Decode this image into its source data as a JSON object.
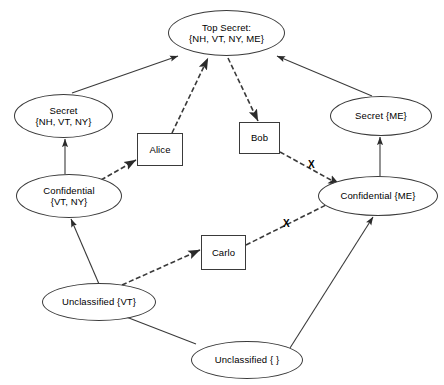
{
  "diagram": {
    "background_color": "#ffffff",
    "stroke_color": "#3a3a3a",
    "text_color": "#000000",
    "nodes": [
      {
        "id": "top-secret",
        "shape": "ellipse",
        "lines": [
          "Top Secret:",
          "{NH, VT, NY, ME}"
        ],
        "x": 168,
        "y": 10,
        "w": 117,
        "h": 46
      },
      {
        "id": "secret-nh-vt-ny",
        "shape": "ellipse",
        "lines": [
          "Secret",
          "{NH, VT, NY}"
        ],
        "x": 14,
        "y": 94,
        "w": 99,
        "h": 44
      },
      {
        "id": "secret-me",
        "shape": "ellipse",
        "lines": [
          "Secret {ME}"
        ],
        "x": 330,
        "y": 96,
        "w": 102,
        "h": 40
      },
      {
        "id": "confidential-vt-ny",
        "shape": "ellipse",
        "lines": [
          "Confidential",
          "{VT, NY}"
        ],
        "x": 16,
        "y": 174,
        "w": 106,
        "h": 44
      },
      {
        "id": "confidential-me",
        "shape": "ellipse",
        "lines": [
          "Confidential {ME}"
        ],
        "x": 318,
        "y": 176,
        "w": 120,
        "h": 40
      },
      {
        "id": "unclassified-vt",
        "shape": "ellipse",
        "lines": [
          "Unclassified {VT}"
        ],
        "x": 42,
        "y": 283,
        "w": 114,
        "h": 38
      },
      {
        "id": "unclassified-empty",
        "shape": "ellipse",
        "lines": [
          "Unclassified { }"
        ],
        "x": 191,
        "y": 341,
        "w": 112,
        "h": 38
      },
      {
        "id": "alice",
        "shape": "rect",
        "lines": [
          "Alice"
        ],
        "x": 137,
        "y": 133,
        "w": 46,
        "h": 33
      },
      {
        "id": "bob",
        "shape": "rect",
        "lines": [
          "Bob"
        ],
        "x": 239,
        "y": 122,
        "w": 41,
        "h": 32
      },
      {
        "id": "carlo",
        "shape": "rect",
        "lines": [
          "Carlo",
          ""
        ],
        "x": 201,
        "y": 235,
        "w": 45,
        "h": 35
      }
    ],
    "edges": [
      {
        "id": "secret-nhvtny-to-top-secret",
        "from": "secret-nh-vt-ny",
        "to": "top-secret",
        "style": "solid",
        "arrow": "end",
        "x1": 72,
        "y1": 93,
        "x2": 178,
        "y2": 56
      },
      {
        "id": "secret-me-to-top-secret",
        "from": "secret-me",
        "to": "top-secret",
        "style": "solid",
        "arrow": "end",
        "x1": 372,
        "y1": 96,
        "x2": 277,
        "y2": 56
      },
      {
        "id": "confidential-vtny-to-secret-nhvtny",
        "from": "confidential-vt-ny",
        "to": "secret-nh-vt-ny",
        "style": "solid",
        "arrow": "end",
        "x1": 65,
        "y1": 174,
        "x2": 65,
        "y2": 139
      },
      {
        "id": "confidential-me-to-secret-me",
        "from": "confidential-me",
        "to": "secret-me",
        "style": "solid",
        "arrow": "end",
        "x1": 380,
        "y1": 176,
        "x2": 380,
        "y2": 137
      },
      {
        "id": "unclassified-vt-to-confidential-vtny",
        "from": "unclassified-vt",
        "to": "confidential-vt-ny",
        "style": "solid",
        "arrow": "end",
        "x1": 99,
        "y1": 284,
        "x2": 71,
        "y2": 219
      },
      {
        "id": "unclassified-empty-to-unclassified-vt",
        "from": "unclassified-empty",
        "to": "unclassified-vt",
        "style": "solid",
        "arrow": "end",
        "x1": 196,
        "y1": 344,
        "x2": 116,
        "y2": 313
      },
      {
        "id": "unclassified-empty-to-confidential-me",
        "from": "unclassified-empty",
        "to": "confidential-me",
        "style": "solid",
        "arrow": "end",
        "x1": 290,
        "y1": 348,
        "x2": 373,
        "y2": 217
      },
      {
        "id": "confidential-vtny-to-alice",
        "from": "confidential-vt-ny",
        "to": "alice",
        "style": "dashed",
        "arrow": "end",
        "x1": 101,
        "y1": 180,
        "x2": 136,
        "y2": 160
      },
      {
        "id": "alice-to-top-secret",
        "from": "alice",
        "to": "top-secret",
        "style": "dashed",
        "arrow": "end",
        "x1": 172,
        "y1": 133,
        "x2": 208,
        "y2": 58
      },
      {
        "id": "top-secret-to-bob",
        "from": "top-secret",
        "to": "bob",
        "style": "dashed",
        "arrow": "end",
        "x1": 228,
        "y1": 58,
        "x2": 258,
        "y2": 121
      },
      {
        "id": "bob-to-confidential-me",
        "from": "bob",
        "to": "confidential-me",
        "style": "dashed",
        "arrow": "end",
        "blocked": true,
        "x1": 280,
        "y1": 152,
        "x2": 340,
        "y2": 185
      },
      {
        "id": "unclassified-vt-to-carlo",
        "from": "unclassified-vt",
        "to": "carlo",
        "style": "dashed",
        "arrow": "end",
        "x1": 122,
        "y1": 285,
        "x2": 200,
        "y2": 250
      },
      {
        "id": "carlo-to-confidential-me",
        "from": "carlo",
        "to": "confidential-me",
        "style": "dashed",
        "arrow": "end",
        "blocked": true,
        "x1": 246,
        "y1": 245,
        "x2": 338,
        "y2": 199
      }
    ],
    "blockers": [
      {
        "id": "x-bob-confidential-me",
        "label": "X",
        "x": 308,
        "y": 160
      },
      {
        "id": "x-carlo-confidential-me",
        "label": "X",
        "x": 283,
        "y": 219
      }
    ]
  }
}
